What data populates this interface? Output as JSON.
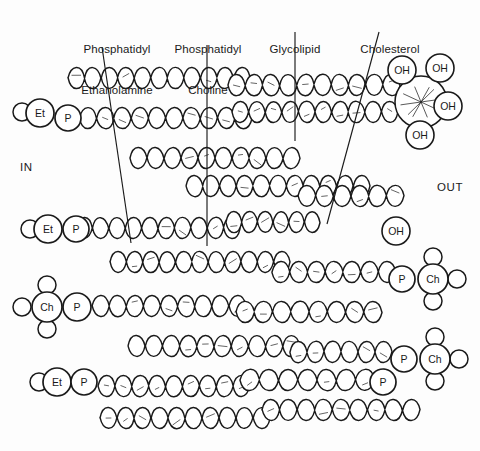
{
  "figure": {
    "background_color": "#fdfdfd",
    "stroke_color": "#1a1a1a",
    "width": 480,
    "height": 451
  },
  "callouts": [
    {
      "id": "phosphatidyl-ethanolamine",
      "line1": "Phosphatidyl",
      "line2": "Ethanolamine",
      "text_x": 117,
      "text_y": 16,
      "align": "center",
      "leader": {
        "x1": 102,
        "y1": 47,
        "x2": 131,
        "y2": 243
      }
    },
    {
      "id": "phosphatidyl-choline",
      "line1": "Phosphatidyl",
      "line2": "Choline",
      "text_x": 208,
      "text_y": 16,
      "align": "center",
      "leader": {
        "x1": 207,
        "y1": 45,
        "x2": 207,
        "y2": 246
      }
    },
    {
      "id": "glycolipid",
      "line1": "Glycolipid",
      "line2": "",
      "text_x": 295,
      "text_y": 16,
      "align": "center",
      "leader": {
        "x1": 295,
        "y1": 32,
        "x2": 295,
        "y2": 141
      }
    },
    {
      "id": "cholesterol",
      "line1": "Cholesterol",
      "line2": "",
      "text_x": 390,
      "text_y": 16,
      "align": "center",
      "leader": {
        "x1": 379,
        "y1": 32,
        "x2": 327,
        "y2": 224
      }
    }
  ],
  "side_labels": [
    {
      "id": "in",
      "text": "IN",
      "x": 20,
      "y": 161
    },
    {
      "id": "out",
      "text": "OUT",
      "x": 437,
      "y": 181
    }
  ],
  "head_groups": [
    {
      "id": "pe-head-1",
      "type": "phosphatidylethanolamine",
      "labels": [
        "Et",
        "P"
      ],
      "cx": [
        40,
        68
      ],
      "cy": [
        113,
        118
      ],
      "r": [
        14,
        13
      ],
      "tail_stub": {
        "cx": 22,
        "cy": 112,
        "r": 9
      }
    },
    {
      "id": "pe-head-2",
      "type": "phosphatidylethanolamine",
      "labels": [
        "Et",
        "P"
      ],
      "cx": [
        48,
        76
      ],
      "cy": [
        229,
        229
      ],
      "r": [
        14,
        13
      ],
      "tail_stub": {
        "cx": 30,
        "cy": 229,
        "r": 9
      }
    },
    {
      "id": "pc-head-left-1",
      "type": "phosphatidylcholine",
      "labels": [
        "Ch",
        "P"
      ],
      "cx": [
        47,
        77
      ],
      "cy": [
        307,
        307
      ],
      "r": [
        15,
        14
      ],
      "methyls": [
        {
          "cx": 47,
          "cy": 285,
          "r": 9
        },
        {
          "cx": 47,
          "cy": 329,
          "r": 9
        },
        {
          "cx": 22,
          "cy": 307,
          "r": 9
        }
      ]
    },
    {
      "id": "pe-head-3",
      "type": "phosphatidylethanolamine",
      "labels": [
        "Et",
        "P"
      ],
      "cx": [
        57,
        383
      ],
      "cy": [
        382,
        382
      ],
      "r": [
        14,
        13
      ],
      "tail_stub": {
        "cx": 39,
        "cy": 382,
        "r": 9
      }
    },
    {
      "id": "pc-head-right-1",
      "type": "phosphatidylcholine",
      "labels": [
        "P",
        "Ch"
      ],
      "cx": [
        402,
        433
      ],
      "cy": [
        279,
        279
      ],
      "r": [
        13,
        15
      ],
      "methyls": [
        {
          "cx": 433,
          "cy": 257,
          "r": 9
        },
        {
          "cx": 433,
          "cy": 301,
          "r": 9
        },
        {
          "cx": 457,
          "cy": 279,
          "r": 9
        }
      ]
    },
    {
      "id": "pc-head-right-2",
      "type": "phosphatidylcholine",
      "labels": [
        "P",
        "Ch"
      ],
      "cx": [
        404,
        435
      ],
      "cy": [
        359,
        359
      ],
      "r": [
        13,
        15
      ],
      "methyls": [
        {
          "cx": 435,
          "cy": 337,
          "r": 9
        },
        {
          "cx": 435,
          "cy": 381,
          "r": 9
        },
        {
          "cx": 459,
          "cy": 359,
          "r": 9
        }
      ]
    }
  ],
  "pe_head_3_second_label": {
    "label": "P",
    "cx": 84,
    "cy": 382,
    "r": 13
  },
  "hydroxyls": [
    {
      "id": "oh-glyco-1",
      "text": "OH",
      "cx": 402,
      "cy": 70,
      "r": 14
    },
    {
      "id": "oh-glyco-2",
      "text": "OH",
      "cx": 440,
      "cy": 68,
      "r": 14
    },
    {
      "id": "oh-glyco-3",
      "text": "OH",
      "cx": 448,
      "cy": 106,
      "r": 14
    },
    {
      "id": "oh-glyco-4",
      "text": "OH",
      "cx": 420,
      "cy": 135,
      "r": 14
    },
    {
      "id": "oh-cholesterol",
      "text": "OH",
      "cx": 396,
      "cy": 231,
      "r": 14
    }
  ],
  "glycolipid_sugar": {
    "id": "sugar-ring",
    "cx": 421,
    "cy": 102,
    "r": 26
  },
  "tail_rows": [
    {
      "id": "tail-row-1",
      "y": 78,
      "x1": 68,
      "x2": 250,
      "lobes": 11
    },
    {
      "id": "tail-row-2",
      "y": 85,
      "x1": 228,
      "x2": 400,
      "lobes": 10
    },
    {
      "id": "tail-row-3",
      "y": 118,
      "x1": 62,
      "x2": 252,
      "lobes": 11
    },
    {
      "id": "tail-row-4",
      "y": 112,
      "x1": 232,
      "x2": 398,
      "lobes": 10
    },
    {
      "id": "tail-row-5",
      "y": 158,
      "x1": 130,
      "x2": 300,
      "lobes": 10
    },
    {
      "id": "tail-row-6",
      "y": 186,
      "x1": 186,
      "x2": 370,
      "lobes": 11
    },
    {
      "id": "tail-row-7",
      "y": 196,
      "x1": 298,
      "x2": 404,
      "lobes": 6
    },
    {
      "id": "tail-row-8",
      "y": 228,
      "x1": 76,
      "x2": 240,
      "lobes": 10
    },
    {
      "id": "tail-row-9",
      "y": 222,
      "x1": 226,
      "x2": 320,
      "lobes": 6
    },
    {
      "id": "tail-row-10",
      "y": 262,
      "x1": 110,
      "x2": 290,
      "lobes": 11
    },
    {
      "id": "tail-row-11",
      "y": 272,
      "x1": 272,
      "x2": 396,
      "lobes": 7
    },
    {
      "id": "tail-row-12",
      "y": 306,
      "x1": 92,
      "x2": 246,
      "lobes": 9
    },
    {
      "id": "tail-row-13",
      "y": 312,
      "x1": 236,
      "x2": 382,
      "lobes": 8
    },
    {
      "id": "tail-row-14",
      "y": 346,
      "x1": 128,
      "x2": 300,
      "lobes": 10
    },
    {
      "id": "tail-row-15",
      "y": 352,
      "x1": 290,
      "x2": 392,
      "lobes": 6
    },
    {
      "id": "tail-row-16",
      "y": 386,
      "x1": 98,
      "x2": 250,
      "lobes": 9
    },
    {
      "id": "tail-row-17",
      "y": 380,
      "x1": 240,
      "x2": 394,
      "lobes": 8
    },
    {
      "id": "tail-row-18",
      "y": 418,
      "x1": 100,
      "x2": 270,
      "lobes": 10
    },
    {
      "id": "tail-row-19",
      "y": 410,
      "x1": 262,
      "x2": 420,
      "lobes": 9
    }
  ]
}
